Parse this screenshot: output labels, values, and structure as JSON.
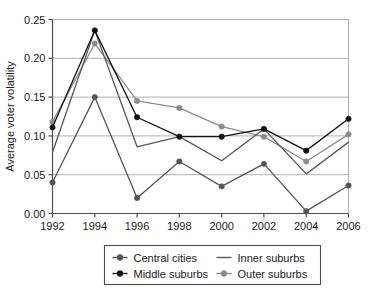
{
  "chart_data": {
    "type": "line",
    "title": "",
    "xlabel": "",
    "ylabel": "Average voter volatility",
    "categories": [
      1992,
      1994,
      1996,
      1998,
      2000,
      2002,
      2004,
      2006
    ],
    "xtick_labels": [
      "1992",
      "1994",
      "1996",
      "1998",
      "2000",
      "2002",
      "2004",
      "2006"
    ],
    "ytick_labels": [
      "0.00",
      "0.05",
      "0.10",
      "0.15",
      "0.20",
      "0.25"
    ],
    "ytick_values": [
      0.0,
      0.05,
      0.1,
      0.15,
      0.2,
      0.25
    ],
    "ylim": [
      0.0,
      0.25
    ],
    "xlim": [
      1992,
      2006
    ],
    "grid": "horizontal",
    "legend_position": "bottom",
    "series": [
      {
        "name": "Central cities",
        "color": "#555555",
        "marker": "circle",
        "values": [
          0.04,
          0.15,
          0.02,
          0.067,
          0.035,
          0.064,
          0.003,
          0.036
        ]
      },
      {
        "name": "Inner suburbs",
        "color": "#555555",
        "marker": "none",
        "values": [
          0.079,
          0.236,
          0.086,
          0.099,
          0.068,
          0.109,
          0.051,
          0.092
        ]
      },
      {
        "name": "Middle suburbs",
        "color": "#111111",
        "marker": "circle",
        "values": [
          0.111,
          0.236,
          0.124,
          0.099,
          0.099,
          0.109,
          0.081,
          0.122
        ]
      },
      {
        "name": "Outer suburbs",
        "color": "#8c8c8c",
        "marker": "circle",
        "values": [
          0.118,
          0.219,
          0.145,
          0.136,
          0.112,
          0.099,
          0.067,
          0.102
        ]
      }
    ]
  },
  "legend": {
    "entries": [
      {
        "label": "Central cities",
        "color": "#555555",
        "marker": "circle"
      },
      {
        "label": "Inner suburbs",
        "color": "#555555",
        "marker": "none"
      },
      {
        "label": "Middle suburbs",
        "color": "#111111",
        "marker": "circle"
      },
      {
        "label": "Outer suburbs",
        "color": "#8c8c8c",
        "marker": "circle"
      }
    ]
  },
  "colors": {
    "axis": "#4d4d4d",
    "grid": "#b0b0b0",
    "background": "#ffffff",
    "text": "#1a1a1a",
    "legend_border": "#4d4d4d"
  }
}
